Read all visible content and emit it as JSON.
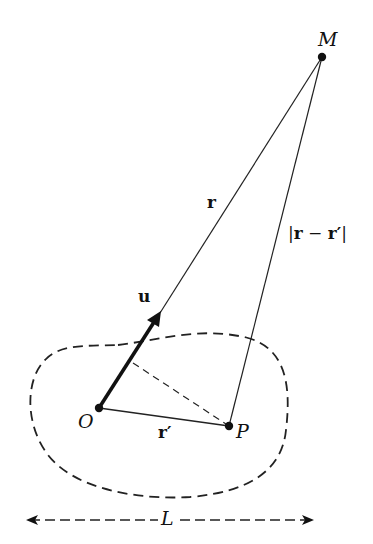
{
  "diagram": {
    "points": {
      "M": {
        "label": "M",
        "x": 322,
        "y": 57
      },
      "O": {
        "label": "O",
        "x": 99,
        "y": 408
      },
      "P": {
        "label": "P",
        "x": 229,
        "y": 426
      }
    },
    "vectors": {
      "r": {
        "label": "r",
        "from": "O",
        "to": "M"
      },
      "r_prime": {
        "label": "r′",
        "from": "O",
        "to": "P"
      },
      "r_minus_r_prime": {
        "label": "|r − r′|",
        "from": "P",
        "to": "M"
      },
      "u": {
        "label": "u",
        "description": "unit vector along r"
      }
    },
    "region": {
      "style": "dashed closed curve",
      "description": "source distribution region"
    },
    "extent": {
      "label": "L",
      "description": "characteristic size of region"
    },
    "projection": {
      "style": "dashed",
      "description": "perpendicular from P onto line OM"
    },
    "colors": {
      "ink": "#111111",
      "background": "#ffffff"
    }
  }
}
